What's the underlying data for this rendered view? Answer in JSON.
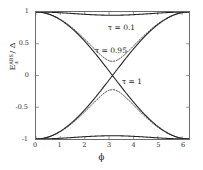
{
  "chart_data": {
    "type": "line",
    "title": "",
    "xlabel": "ϕ",
    "ylabel_parts": {
      "base": "E",
      "sup": "ABS",
      "sub": "±",
      "denom": "Δ"
    },
    "ylabel": "E±^ABS / Δ",
    "xlim": [
      0,
      6.2832
    ],
    "ylim": [
      -1,
      1
    ],
    "xticks": [
      0,
      1,
      2,
      3,
      4,
      5,
      6
    ],
    "xtick_labels": [
      "0",
      "1",
      "2",
      "3",
      "4",
      "5",
      "6"
    ],
    "yticks": [
      -1,
      -0.5,
      0,
      0.5,
      1
    ],
    "ytick_labels": [
      "-1",
      "-0.5",
      "0",
      "0.5",
      "1"
    ],
    "grid": false,
    "legend_position": "inline-annotations",
    "formula": "E = ± sqrt(1 - tau*sin^2(phi/2))",
    "series": [
      {
        "name": "τ = 0.1 (upper)",
        "tau": 0.1,
        "branch": 1,
        "style": "solid",
        "color": "#222222",
        "x": [
          0,
          0.3927,
          0.7854,
          1.1781,
          1.5708,
          1.9635,
          2.3562,
          2.7489,
          3.1416,
          3.5343,
          3.927,
          4.3197,
          4.7124,
          5.1051,
          5.4978,
          5.8905,
          6.2832
        ],
        "y": [
          1.0,
          0.9981,
          0.9925,
          0.9836,
          0.9747,
          0.9675,
          0.9624,
          0.9594,
          0.9587,
          0.9594,
          0.9624,
          0.9675,
          0.9747,
          0.9836,
          0.9925,
          0.9981,
          1.0
        ]
      },
      {
        "name": "τ = 0.1 (lower)",
        "tau": 0.1,
        "branch": -1,
        "style": "solid",
        "color": "#222222",
        "x": [
          0,
          0.7854,
          1.5708,
          2.3562,
          3.1416,
          3.927,
          4.7124,
          5.4978,
          6.2832
        ],
        "y": [
          -1.0,
          -0.9925,
          -0.9747,
          -0.9624,
          -0.9587,
          -0.9624,
          -0.9747,
          -0.9925,
          -1.0
        ]
      },
      {
        "name": "τ = 0.95 (upper)",
        "tau": 0.95,
        "branch": 1,
        "style": "dotted",
        "color": "#333333",
        "x": [
          0,
          0.3927,
          0.7854,
          1.1781,
          1.5708,
          1.9635,
          2.3562,
          2.7489,
          3.1416,
          3.5343,
          3.927,
          4.3197,
          4.7124,
          5.1051,
          5.4978,
          5.8905,
          6.2832
        ],
        "y": [
          1.0,
          0.9816,
          0.9296,
          0.8506,
          0.7566,
          0.6608,
          0.5757,
          0.5131,
          0.4899,
          0.5131,
          0.5757,
          0.6608,
          0.7566,
          0.8506,
          0.9296,
          0.9816,
          1.0
        ]
      },
      {
        "name": "τ = 0.95 (lower)",
        "tau": 0.95,
        "branch": -1,
        "style": "dotted",
        "color": "#333333",
        "x": [
          0,
          0.7854,
          1.5708,
          2.3562,
          3.1416,
          3.927,
          4.7124,
          5.4978,
          6.2832
        ],
        "y": [
          -1.0,
          -0.9296,
          -0.7566,
          -0.5757,
          -0.4899,
          -0.5757,
          -0.7566,
          -0.9296,
          -1.0
        ]
      },
      {
        "name": "τ = 1 (upper)",
        "tau": 1,
        "branch": 1,
        "style": "solid",
        "color": "#222222",
        "x": [
          0,
          0.3927,
          0.7854,
          1.1781,
          1.5708,
          1.9635,
          2.3562,
          2.7489,
          3.1416,
          3.5343,
          3.927,
          4.3197,
          4.7124,
          5.1051,
          5.4978,
          5.8905,
          6.2832
        ],
        "y": [
          1.0,
          0.9808,
          0.9239,
          0.8315,
          0.7071,
          0.5556,
          0.3827,
          0.1951,
          0.0,
          0.1951,
          0.3827,
          0.5556,
          0.7071,
          0.8315,
          0.9239,
          0.9808,
          1.0
        ]
      },
      {
        "name": "τ = 1 (lower)",
        "tau": 1,
        "branch": -1,
        "style": "solid",
        "color": "#222222",
        "x": [
          0,
          0.7854,
          1.5708,
          2.3562,
          3.1416,
          3.927,
          4.7124,
          5.4978,
          6.2832
        ],
        "y": [
          -1.0,
          -0.9239,
          -0.7071,
          -0.3827,
          0.0,
          -0.3827,
          -0.7071,
          -0.9239,
          -1.0
        ]
      }
    ],
    "annotations": [
      {
        "text": "τ = 0.1",
        "x": 3.0,
        "y": 0.82
      },
      {
        "text": "τ = 0.95",
        "x": 2.6,
        "y": 0.46
      },
      {
        "text": "τ = 1",
        "x": 3.7,
        "y": 0.0
      }
    ]
  },
  "axes": {
    "frame_color": "#6b6b6b",
    "background": "#ffffff"
  }
}
